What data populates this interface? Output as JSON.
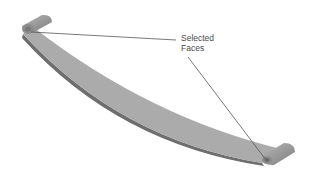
{
  "figure": {
    "callout": {
      "line1": "Selected",
      "line2": "Faces"
    },
    "colors": {
      "background": "#ffffff",
      "spring_face": "#a9a9a9",
      "spring_edge": "#6e6e6e",
      "leader_line": "#555555",
      "label_text": "#4a4a4a"
    }
  }
}
